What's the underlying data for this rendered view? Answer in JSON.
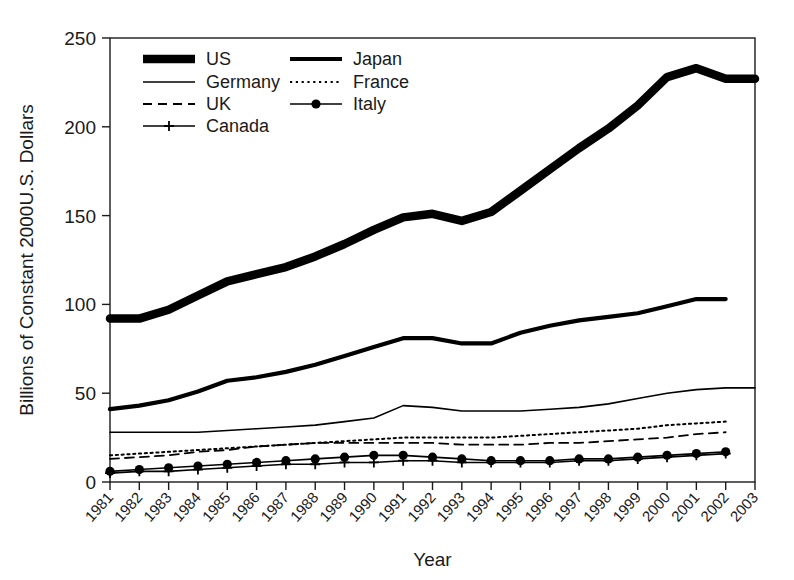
{
  "chart_data": {
    "type": "line",
    "title": "",
    "xlabel": "Year",
    "ylabel": "Billions of Constant 2000U.S. Dollars",
    "grid": false,
    "legend_position": "top-left-inside",
    "xlim": [
      1981,
      2003
    ],
    "ylim": [
      0,
      250
    ],
    "ytick_labels": [
      "0",
      "50",
      "100",
      "150",
      "200",
      "250"
    ],
    "ytick_values": [
      0,
      50,
      100,
      150,
      200,
      250
    ],
    "x": [
      1981,
      1982,
      1983,
      1984,
      1985,
      1986,
      1987,
      1988,
      1989,
      1990,
      1991,
      1992,
      1993,
      1994,
      1995,
      1996,
      1997,
      1998,
      1999,
      2000,
      2001,
      2002,
      2003
    ],
    "xtick_labels": [
      "1981",
      "1982",
      "1983",
      "1984",
      "1985",
      "1986",
      "1987",
      "1988",
      "1989",
      "1990",
      "1991",
      "1992",
      "1993",
      "1994",
      "1995",
      "1996",
      "1997",
      "1998",
      "1999",
      "2000",
      "2001",
      "2002",
      "2003"
    ],
    "series": [
      {
        "name": "US",
        "style": "very-thick-solid",
        "marker": "none",
        "color": "#000000",
        "x": [
          1981,
          1982,
          1983,
          1984,
          1985,
          1986,
          1987,
          1988,
          1989,
          1990,
          1991,
          1992,
          1993,
          1994,
          1995,
          1996,
          1997,
          1998,
          1999,
          2000,
          2001,
          2002,
          2003
        ],
        "values": [
          92,
          92,
          97,
          105,
          113,
          117,
          121,
          127,
          134,
          142,
          149,
          151,
          147,
          152,
          164,
          176,
          188,
          199,
          212,
          228,
          233,
          227,
          227
        ]
      },
      {
        "name": "Japan",
        "style": "thick-solid",
        "marker": "none",
        "color": "#000000",
        "x": [
          1981,
          1982,
          1983,
          1984,
          1985,
          1986,
          1987,
          1988,
          1989,
          1990,
          1991,
          1992,
          1993,
          1994,
          1995,
          1996,
          1997,
          1998,
          1999,
          2000,
          2001,
          2002
        ],
        "values": [
          41,
          43,
          46,
          51,
          57,
          59,
          62,
          66,
          71,
          76,
          81,
          81,
          78,
          78,
          84,
          88,
          91,
          93,
          95,
          99,
          103,
          103
        ]
      },
      {
        "name": "Germany",
        "style": "thin-solid",
        "marker": "none",
        "color": "#000000",
        "x": [
          1981,
          1982,
          1983,
          1984,
          1985,
          1986,
          1987,
          1988,
          1989,
          1990,
          1991,
          1992,
          1993,
          1994,
          1995,
          1996,
          1997,
          1998,
          1999,
          2000,
          2001,
          2002,
          2003
        ],
        "values": [
          28,
          28,
          28,
          28,
          29,
          30,
          31,
          32,
          34,
          36,
          43,
          42,
          40,
          40,
          40,
          41,
          42,
          44,
          47,
          50,
          52,
          53,
          53
        ]
      },
      {
        "name": "France",
        "style": "dotted",
        "marker": "none",
        "color": "#000000",
        "x": [
          1981,
          1982,
          1983,
          1984,
          1985,
          1986,
          1987,
          1988,
          1989,
          1990,
          1991,
          1992,
          1993,
          1994,
          1995,
          1996,
          1997,
          1998,
          1999,
          2000,
          2001,
          2002
        ],
        "values": [
          15,
          16,
          17,
          18,
          19,
          20,
          21,
          22,
          23,
          24,
          25,
          25,
          25,
          25,
          26,
          27,
          28,
          29,
          30,
          32,
          33,
          34
        ]
      },
      {
        "name": "UK",
        "style": "dashed",
        "marker": "none",
        "color": "#000000",
        "x": [
          1981,
          1982,
          1983,
          1984,
          1985,
          1986,
          1987,
          1988,
          1989,
          1990,
          1991,
          1992,
          1993,
          1994,
          1995,
          1996,
          1997,
          1998,
          1999,
          2000,
          2001,
          2002
        ],
        "values": [
          13,
          14,
          15,
          17,
          18,
          20,
          21,
          22,
          22,
          22,
          22,
          22,
          21,
          21,
          21,
          22,
          22,
          23,
          24,
          25,
          27,
          28
        ]
      },
      {
        "name": "Italy",
        "style": "thin-solid",
        "marker": "circle",
        "color": "#000000",
        "x": [
          1981,
          1982,
          1983,
          1984,
          1985,
          1986,
          1987,
          1988,
          1989,
          1990,
          1991,
          1992,
          1993,
          1994,
          1995,
          1996,
          1997,
          1998,
          1999,
          2000,
          2001,
          2002
        ],
        "values": [
          6,
          7,
          8,
          9,
          10,
          11,
          12,
          13,
          14,
          15,
          15,
          14,
          13,
          12,
          12,
          12,
          13,
          13,
          14,
          15,
          16,
          17
        ]
      },
      {
        "name": "Canada",
        "style": "thin-solid",
        "marker": "plus",
        "color": "#000000",
        "x": [
          1981,
          1982,
          1983,
          1984,
          1985,
          1986,
          1987,
          1988,
          1989,
          1990,
          1991,
          1992,
          1993,
          1994,
          1995,
          1996,
          1997,
          1998,
          1999,
          2000,
          2001,
          2002
        ],
        "values": [
          5,
          6,
          6,
          7,
          8,
          9,
          10,
          10,
          11,
          11,
          12,
          12,
          11,
          11,
          11,
          11,
          12,
          12,
          13,
          14,
          15,
          16
        ]
      }
    ],
    "legend": [
      {
        "label": "US",
        "style": "very-thick-solid",
        "marker": "none"
      },
      {
        "label": "Japan",
        "style": "thick-solid",
        "marker": "none"
      },
      {
        "label": "Germany",
        "style": "thin-solid",
        "marker": "none"
      },
      {
        "label": "France",
        "style": "dotted",
        "marker": "none"
      },
      {
        "label": "UK",
        "style": "dashed",
        "marker": "none"
      },
      {
        "label": "Italy",
        "style": "thin-solid",
        "marker": "circle"
      },
      {
        "label": "Canada",
        "style": "thin-solid",
        "marker": "plus"
      }
    ]
  }
}
